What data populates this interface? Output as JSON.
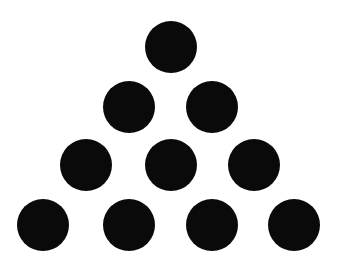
{
  "figure": {
    "background": "#ffffff",
    "dot_color": "#0a0a0a",
    "radius": 26,
    "rows": [
      {
        "count": 1,
        "cy": 47,
        "cx": [
          171
        ]
      },
      {
        "count": 2,
        "cy": 107,
        "cx": [
          129,
          212
        ]
      },
      {
        "count": 3,
        "cy": 165,
        "cx": [
          86,
          171,
          254
        ]
      },
      {
        "count": 4,
        "cy": 225,
        "cx": [
          43,
          129,
          212,
          294
        ]
      }
    ],
    "total_dots": 10
  }
}
